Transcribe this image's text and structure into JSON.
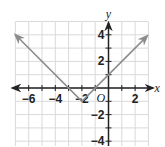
{
  "chart_data": {
    "type": "line",
    "title": "",
    "xlabel": "x",
    "ylabel": "y",
    "origin_label": "O",
    "xlim": [
      -7,
      3
    ],
    "ylim": [
      -5,
      5
    ],
    "grid": true,
    "x_ticks": [
      -6,
      -4,
      -2,
      2
    ],
    "y_ticks": [
      4,
      2,
      -2,
      -4
    ],
    "x_tick_labels": [
      "−6",
      "−4",
      "−2",
      "2"
    ],
    "y_tick_labels": [
      "4",
      "2",
      "−2",
      "−4"
    ],
    "series": [
      {
        "name": "y = |x + 2| − 1",
        "points": [
          [
            -7,
            4
          ],
          [
            -2,
            -1
          ],
          [
            2.9,
            3.9
          ]
        ],
        "vertex": [
          -2,
          -1
        ],
        "x_intercepts": [
          -3,
          -1
        ],
        "y_intercept": 1,
        "arrows_both_ends": true
      }
    ]
  },
  "colors": {
    "grid": "#d9d9d9",
    "axis": "#222222",
    "line": "#8c8c8c"
  }
}
